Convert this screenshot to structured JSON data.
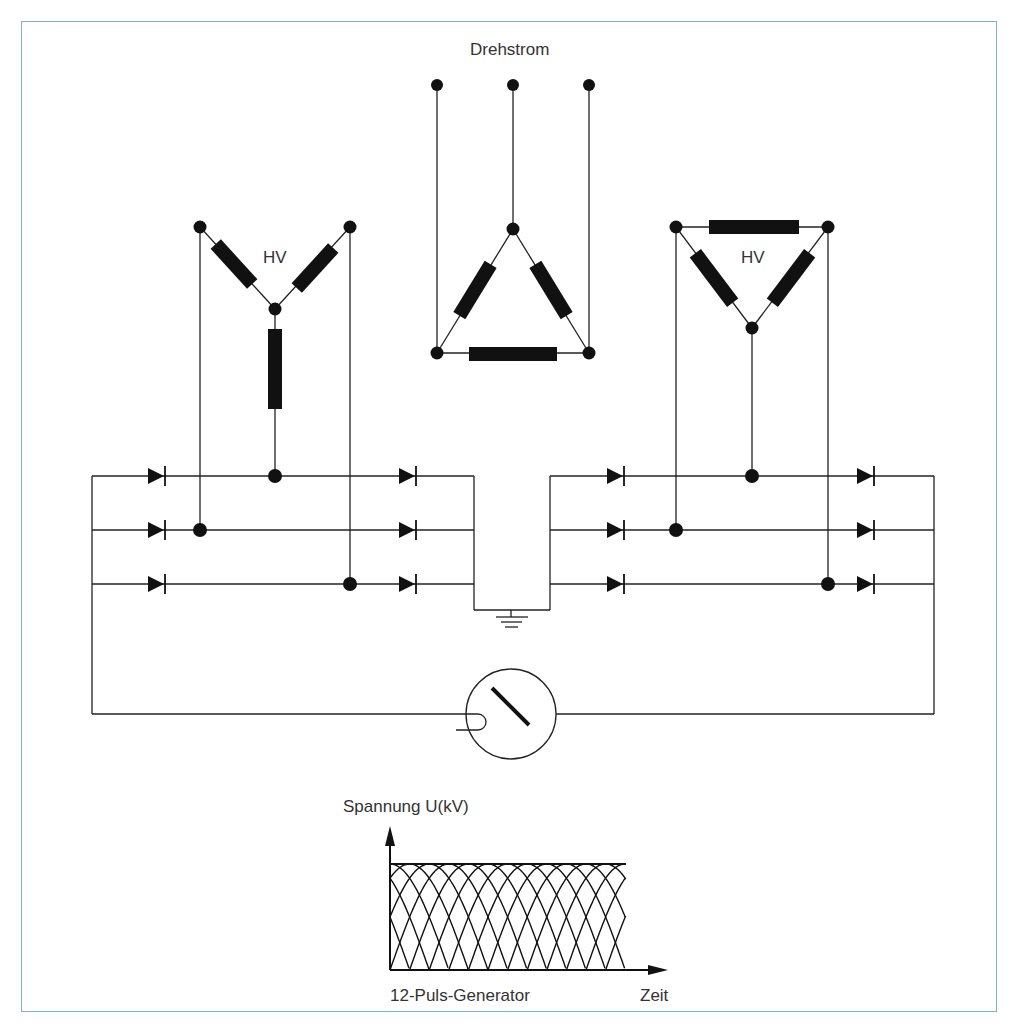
{
  "title": "Drehstrom",
  "labels": {
    "hv_left": "HV",
    "hv_right": "HV"
  },
  "chart_data": {
    "type": "line",
    "title": "12-Puls-Generator",
    "xlabel": "Zeit",
    "ylabel": "Spannung  U(kV)",
    "pulses_per_period": 12,
    "series": [
      {
        "name": "envelope",
        "shape": "near-constant ripple at peak"
      }
    ],
    "grid": false
  },
  "chart_labels": {
    "ylabel": "Spannung  U(kV)",
    "xlabel": "Zeit",
    "caption": "12-Puls-Generator"
  },
  "colors": {
    "frame": "#7fb3c8",
    "ink": "#111111",
    "text": "#333333"
  }
}
